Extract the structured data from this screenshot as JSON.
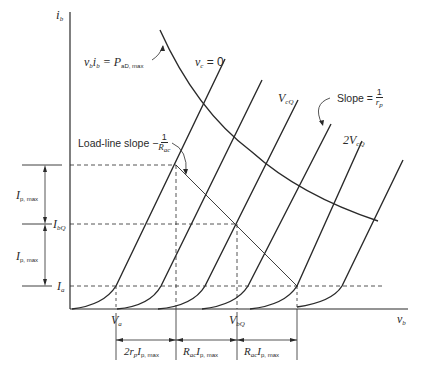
{
  "diagram": {
    "axes": {
      "y_label": "i",
      "y_label_sub": "b",
      "x_label": "v",
      "x_label_sub": "b"
    },
    "curve_labels": {
      "vc_zero": {
        "main": "v",
        "sub": "c",
        "rest": " = 0"
      },
      "vcq": {
        "main": "V",
        "sub": "cQ"
      },
      "two_vcq": {
        "main": "2V",
        "sub": "cQ"
      }
    },
    "annotations": {
      "power_hyperbola": {
        "left": "v",
        "left_sub": "b",
        "mid": "i",
        "mid_sub": "b",
        "eq": " = P",
        "p_sub": "aD, max"
      },
      "load_line": {
        "text": "Load-line slope −",
        "num": "1",
        "den": "R",
        "den_sub": "ac"
      },
      "plate_slope": {
        "text": "Slope = ",
        "num": "1",
        "den": "r",
        "den_sub": "p"
      }
    },
    "y_markers": {
      "ip_max_upper": {
        "main": "I",
        "sub": "p, max"
      },
      "ibq": {
        "main": "I",
        "sub": "bQ"
      },
      "ip_max_lower": {
        "main": "I",
        "sub": "p, max"
      },
      "ia": {
        "main": "I",
        "sub": "a"
      }
    },
    "x_markers": {
      "va": {
        "main": "V",
        "sub": "a"
      },
      "vbq": {
        "main": "V",
        "sub": "bQ"
      }
    },
    "dimension_labels": [
      {
        "pre": "2r",
        "pre_sub": "p",
        "main": "I",
        "sub": "p, max"
      },
      {
        "pre": "R",
        "pre_sub": "ac",
        "main": "I",
        "sub": "p, max"
      },
      {
        "pre": "R",
        "pre_sub": "ac",
        "main": "I",
        "sub": "p, max"
      }
    ],
    "colors": {
      "ink": "#2a2a2a",
      "background": "#ffffff"
    }
  }
}
